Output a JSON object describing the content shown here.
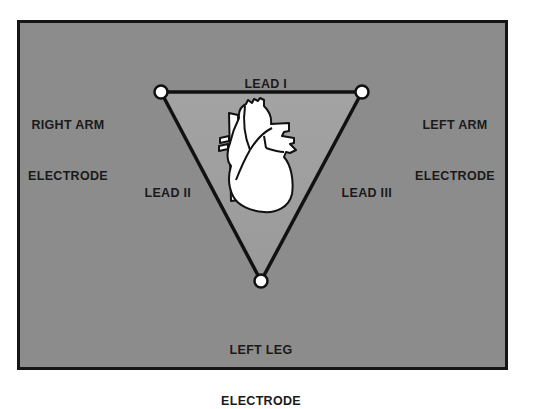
{
  "diagram": {
    "electrodes": [
      {
        "id": "right-arm",
        "label_line1": "RIGHT ARM",
        "label_line2": "ELECTRODE"
      },
      {
        "id": "left-arm",
        "label_line1": "LEFT ARM",
        "label_line2": "ELECTRODE"
      },
      {
        "id": "left-leg",
        "label_line1": "LEFT LEG",
        "label_line2": "ELECTRODE"
      }
    ],
    "leads": [
      {
        "id": "lead-1",
        "label": "LEAD I",
        "connects": [
          "right-arm",
          "left-arm"
        ]
      },
      {
        "id": "lead-2",
        "label": "LEAD II",
        "connects": [
          "right-arm",
          "left-leg"
        ]
      },
      {
        "id": "lead-3",
        "label": "LEAD III",
        "connects": [
          "left-arm",
          "left-leg"
        ]
      }
    ],
    "center_icon": "heart-icon",
    "colors": {
      "background": "#8c8c8c",
      "triangle_fill": "#a6a6a6",
      "line": "#111111",
      "electrode_fill": "#ffffff",
      "heart_fill": "#ffffff"
    }
  }
}
